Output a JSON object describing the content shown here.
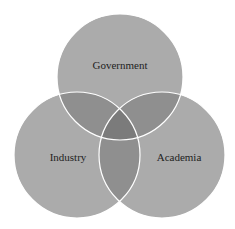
{
  "diagram": {
    "type": "venn-3",
    "colors": {
      "background": "#ffffff",
      "circle_fill": "#ababab",
      "pair_overlap": "#8f8f8f",
      "triple_overlap": "#7b7b7b",
      "stroke": "#ffffff",
      "text": "#1e1e1e"
    },
    "sets": [
      {
        "id": "government",
        "label": "Government",
        "cx": 120,
        "cy": 77,
        "r": 63,
        "label_x": 120,
        "label_y": 68
      },
      {
        "id": "industry",
        "label": "Industry",
        "cx": 77,
        "cy": 155,
        "r": 63,
        "label_x": 67,
        "label_y": 160
      },
      {
        "id": "academia",
        "label": "Academia",
        "cx": 162,
        "cy": 155,
        "r": 63,
        "label_x": 179,
        "label_y": 160
      }
    ]
  }
}
